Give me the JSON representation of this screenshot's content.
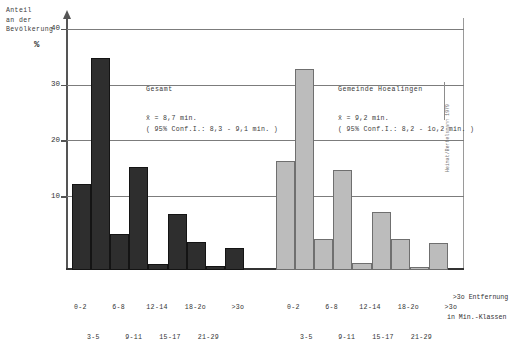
{
  "figure": {
    "y_axis_caption": "Anteil\nan der\nBevölkerung",
    "y_axis_unit": "%",
    "x_axis_title_line1": ">3o Entfernung",
    "x_axis_title_line2": "in Min.-Klassen",
    "source_credit": "Heimat/Bertelsmann 1979"
  },
  "panels": {
    "left": {
      "title": "Gesamt",
      "mean": "x̄ = 8,7 min.",
      "ci": "( 95% Conf.I.: 8,3 - 9,1 min. )",
      "color": "#2e2e2e"
    },
    "right": {
      "title": "Gemeinde Hoealingen",
      "mean": "x̄ = 9,2 min.",
      "ci": "( 95% Conf.I.: 8,2 - 1o,2 min. )",
      "color": "#bcbcbc"
    }
  },
  "axis": {
    "y_ticks": [
      "10",
      "20",
      "30",
      "40"
    ],
    "x_labels_row1": "0-2      6-8     12-14    18-2o      >3o",
    "x_labels_row2": "3-5      9-11    15-17    21-29"
  },
  "chart_data": {
    "type": "bar",
    "xlabel": "Entfernung in Min.-Klassen",
    "ylabel": "Anteil an der Bevölkerung %",
    "ylim": [
      0,
      42
    ],
    "yticks": [
      10,
      20,
      30,
      40
    ],
    "grid": true,
    "legend": false,
    "categories": [
      "0-2",
      "3-5",
      "6-8",
      "9-11",
      "12-14",
      "15-17",
      "18-2o",
      "21-29",
      ">3o"
    ],
    "series": [
      {
        "name": "Gesamt",
        "color": "#2e2e2e",
        "mean_minutes": 8.7,
        "conf_int_95": [
          8.3,
          9.1
        ],
        "values": [
          15.5,
          38.0,
          6.5,
          18.5,
          1.0,
          10.0,
          5.0,
          0.7,
          4.0
        ]
      },
      {
        "name": "Gemeinde Hoealingen",
        "color": "#bcbcbc",
        "mean_minutes": 9.2,
        "conf_int_95": [
          8.2,
          10.2
        ],
        "values": [
          19.5,
          36.0,
          5.5,
          18.0,
          1.2,
          10.5,
          5.5,
          0.6,
          4.8
        ]
      }
    ],
    "annotations": [
      "Gesamt: x̄ = 8,7 min. ( 95% Conf.I.: 8,3 - 9,1 min. )",
      "Gemeinde Hoealingen: x̄ = 9,2 min. ( 95% Conf.I.: 8,2 - 1o,2 min. )"
    ]
  }
}
